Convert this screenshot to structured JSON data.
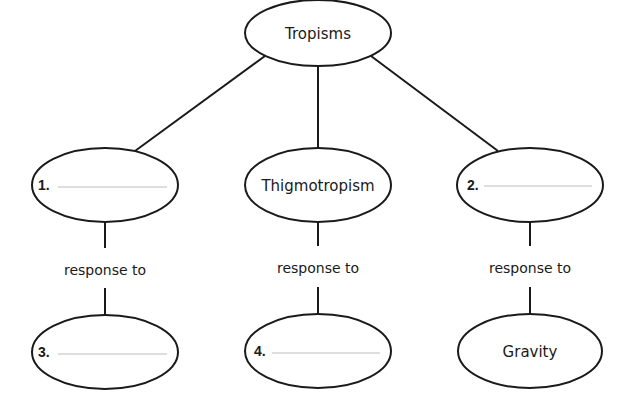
{
  "diagram": {
    "root": {
      "label": "Tropisms"
    },
    "branches": [
      {
        "type": {
          "number": "1.",
          "label": ""
        },
        "edge_label": "response to",
        "stimulus": {
          "number": "3.",
          "label": ""
        }
      },
      {
        "type": {
          "number": "",
          "label": "Thigmotropism"
        },
        "edge_label": "response to",
        "stimulus": {
          "number": "4.",
          "label": ""
        }
      },
      {
        "type": {
          "number": "2.",
          "label": ""
        },
        "edge_label": "response to",
        "stimulus": {
          "number": "",
          "label": "Gravity"
        }
      }
    ]
  },
  "colors": {
    "stroke": "#1a1a1a",
    "blank_line": "#bdbdbd",
    "background": "#ffffff"
  }
}
